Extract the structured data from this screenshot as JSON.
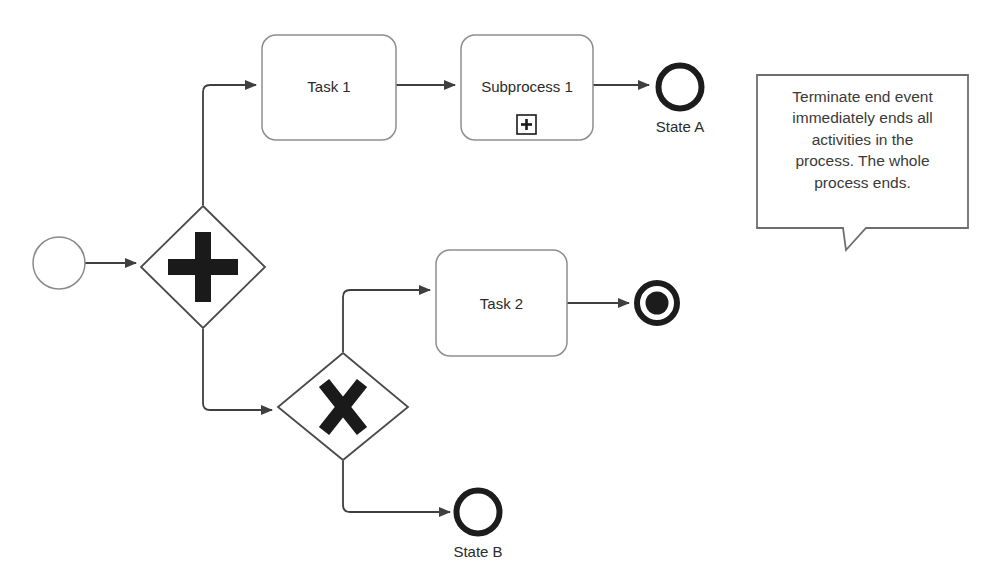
{
  "diagram": {
    "type": "bpmn-process-diagram",
    "background_color": "#ffffff",
    "line_color": "#3f3f3f",
    "shape_border_color": "#808080",
    "bold_marker_color": "#1a1a1a"
  },
  "nodes": {
    "start_event": {
      "name": "start-event",
      "shape": "circle-thin",
      "label": ""
    },
    "parallel_gateway": {
      "name": "parallel-gateway",
      "shape": "diamond",
      "marker": "plus",
      "marker_glyph": "+",
      "label": ""
    },
    "task_1": {
      "name": "task-1",
      "shape": "rounded-rect",
      "label": "Task 1"
    },
    "subprocess_1": {
      "name": "subprocess-1",
      "shape": "rounded-rect",
      "label": "Subprocess 1",
      "marker": "expand-collapsed",
      "marker_glyph": "+"
    },
    "end_event_state_a": {
      "name": "end-event-state-a",
      "shape": "circle-thick",
      "label": "State A"
    },
    "exclusive_gateway": {
      "name": "exclusive-gateway",
      "shape": "diamond",
      "marker": "cross",
      "marker_glyph": "X",
      "label": ""
    },
    "task_2": {
      "name": "task-2",
      "shape": "rounded-rect",
      "label": "Task 2"
    },
    "terminate_end_event": {
      "name": "terminate-end-event",
      "shape": "circle-thick-filled",
      "label": ""
    },
    "end_event_state_b": {
      "name": "end-event-state-b",
      "shape": "circle-thick",
      "label": "State B"
    }
  },
  "annotation": {
    "name": "terminate-annotation-callout",
    "lines": [
      "Terminate end event",
      "immediately ends all",
      "activities in the",
      "process. The whole",
      "process ends."
    ],
    "text": "Terminate end event immediately ends all activities in the process. The whole process ends."
  },
  "flows": [
    {
      "from": "start_event",
      "to": "parallel_gateway"
    },
    {
      "from": "parallel_gateway",
      "to": "task_1"
    },
    {
      "from": "task_1",
      "to": "subprocess_1"
    },
    {
      "from": "subprocess_1",
      "to": "end_event_state_a"
    },
    {
      "from": "parallel_gateway",
      "to": "exclusive_gateway"
    },
    {
      "from": "exclusive_gateway",
      "to": "task_2"
    },
    {
      "from": "task_2",
      "to": "terminate_end_event"
    },
    {
      "from": "exclusive_gateway",
      "to": "end_event_state_b"
    }
  ]
}
